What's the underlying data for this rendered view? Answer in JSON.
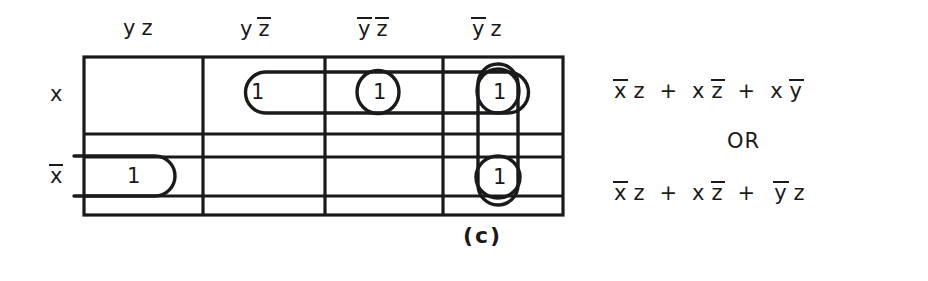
{
  "figure": {
    "caption": "(c)",
    "type": "karnaugh-map"
  },
  "kmap": {
    "column_headers": [
      {
        "var_y": "y",
        "y_bar": false,
        "var_z": "z",
        "z_bar": false,
        "text": "y z"
      },
      {
        "var_y": "y",
        "y_bar": false,
        "var_z": "z",
        "z_bar": true,
        "text": "y z̄"
      },
      {
        "var_y": "y",
        "y_bar": true,
        "var_z": "z",
        "z_bar": true,
        "text": "ȳ z̄"
      },
      {
        "var_y": "y",
        "y_bar": true,
        "var_z": "z",
        "z_bar": false,
        "text": "ȳ z"
      }
    ],
    "row_headers": [
      {
        "var_x": "x",
        "x_bar": false,
        "text": "x"
      },
      {
        "var_x": "x",
        "x_bar": true,
        "text": "x̄"
      }
    ],
    "cells": [
      {
        "row": 0,
        "col": 0,
        "value": ""
      },
      {
        "row": 0,
        "col": 1,
        "value": "1"
      },
      {
        "row": 0,
        "col": 2,
        "value": "1"
      },
      {
        "row": 0,
        "col": 3,
        "value": "1"
      },
      {
        "row": 1,
        "col": 0,
        "value": "1"
      },
      {
        "row": 1,
        "col": 1,
        "value": ""
      },
      {
        "row": 1,
        "col": 2,
        "value": ""
      },
      {
        "row": 1,
        "col": 3,
        "value": "1"
      }
    ],
    "groups": [
      {
        "name": "top-row-horizontal-group",
        "shape": "pill-horizontal",
        "cells": "row0 col1-col3"
      },
      {
        "name": "column4-vertical-group",
        "shape": "pill-vertical",
        "cells": "col3 row0-row1"
      },
      {
        "name": "bottom-left-wrap-group",
        "shape": "pill-wrap-left",
        "cells": "row1 col0"
      },
      {
        "name": "top-middle-circle-group",
        "shape": "circle",
        "cells": "row0 col2"
      },
      {
        "name": "top-right-circle-group",
        "shape": "circle",
        "cells": "row0 col3"
      },
      {
        "name": "bottom-right-circle-group",
        "shape": "circle",
        "cells": "row1 col3"
      }
    ]
  },
  "expressions": {
    "first": "x̄ z  +  x z̄  +  x ȳ",
    "connector": "OR",
    "second": "x̄ z  +  x z̄  +  ȳ z",
    "first_terms": [
      "x̄ z",
      "x z̄",
      "x ȳ"
    ],
    "second_terms": [
      "x̄ z",
      "x z̄",
      "ȳ z"
    ],
    "operator": "+"
  },
  "colors": {
    "ink": "#1a1a1a",
    "background": "#ffffff"
  }
}
